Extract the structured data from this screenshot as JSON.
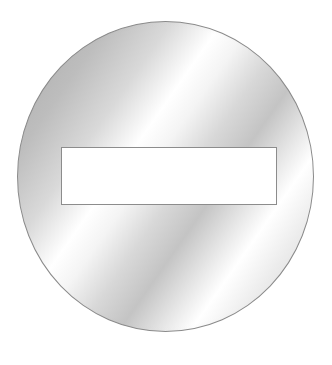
{
  "image": {
    "subject": "no-entry-sign",
    "description": "Circular metallic-gray sign with a horizontal white bar",
    "colors": {
      "background": "#ffffff",
      "sign_dark": "#a9a9a9",
      "sign_light": "#ffffff",
      "bar": "#ffffff",
      "outline": "#8a8a8a"
    }
  }
}
